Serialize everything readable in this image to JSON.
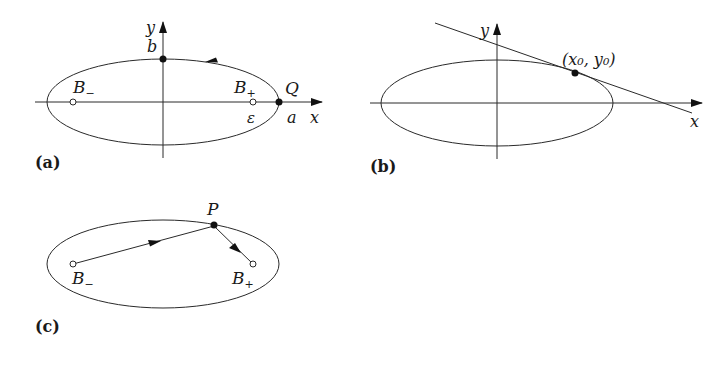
{
  "figure": {
    "panels": [
      {
        "id": "a",
        "label": "(a)",
        "axis_labels": {
          "x": "x",
          "y": "y"
        },
        "points": {
          "b": "b",
          "Q": "Q",
          "a": "a",
          "epsilon": "ε",
          "B_minus": {
            "base": "B",
            "sub": "−"
          },
          "B_plus": {
            "base": "B",
            "sub": "+"
          }
        }
      },
      {
        "id": "b",
        "label": "(b)",
        "axis_labels": {
          "x": "x",
          "y": "y"
        },
        "tangent_point": "(x₀, y₀)"
      },
      {
        "id": "c",
        "label": "(c)",
        "points": {
          "P": "P",
          "B_minus": {
            "base": "B",
            "sub": "−"
          },
          "B_plus": {
            "base": "B",
            "sub": "+"
          }
        }
      }
    ]
  }
}
